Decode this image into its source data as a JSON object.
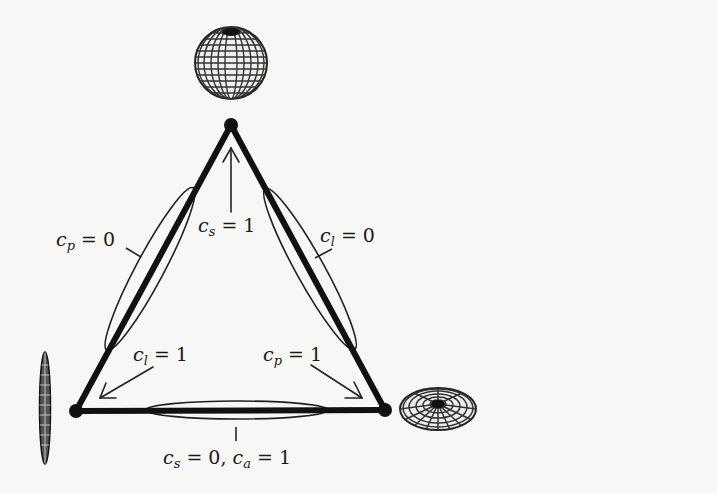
{
  "diagram": {
    "type": "barycentric-triangle",
    "colors": {
      "background": "#f7f7f5",
      "ink": "#111111",
      "thin_line": "#222222",
      "glyph_fill": "#e8e8e8"
    },
    "vertices": [
      {
        "id": "top",
        "glyph": "sphere",
        "x": 231,
        "y": 125
      },
      {
        "id": "bottom-left",
        "glyph": "needle",
        "x": 76,
        "y": 411
      },
      {
        "id": "bottom-right",
        "glyph": "disc",
        "x": 385,
        "y": 410
      }
    ],
    "labels": {
      "cs_eq_1": {
        "var": "c",
        "sub": "s",
        "eq": "= 1"
      },
      "cp_eq_0": {
        "var": "c",
        "sub": "p",
        "eq": "= 0"
      },
      "cl_eq_0": {
        "var": "c",
        "sub": "l",
        "eq": "= 0"
      },
      "cl_eq_1": {
        "var": "c",
        "sub": "l",
        "eq": "= 1"
      },
      "cp_eq_1": {
        "var": "c",
        "sub": "p",
        "eq": "= 1"
      },
      "cs_eq_0_ca_eq_1": {
        "var": "c",
        "sub": "s",
        "eq": "= 0,",
        "var2": "c",
        "sub2": "a",
        "eq2": "= 1"
      }
    },
    "edges": [
      {
        "from": "top",
        "to": "bottom-left",
        "marker_label": "cp_eq_0"
      },
      {
        "from": "top",
        "to": "bottom-right",
        "marker_label": "cl_eq_0"
      },
      {
        "from": "bottom-left",
        "to": "bottom-right",
        "marker_label": "cs_eq_0_ca_eq_1"
      }
    ],
    "arrows": [
      {
        "label": "cs_eq_1",
        "points_to": "top"
      },
      {
        "label": "cl_eq_1",
        "points_to": "bottom-left"
      },
      {
        "label": "cp_eq_1",
        "points_to": "bottom-right"
      }
    ]
  }
}
